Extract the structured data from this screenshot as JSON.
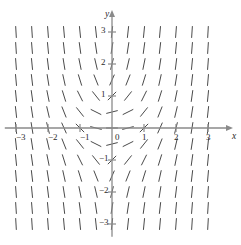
{
  "figure": {
    "type": "slope-field",
    "title": "",
    "background_color": "#ffffff",
    "width": 241,
    "height": 245
  },
  "axes": {
    "origin_px": {
      "x": 112,
      "y": 128
    },
    "unit_px": 32,
    "color": "#8a8a8a",
    "x_axis": {
      "name": "x",
      "name_px": {
        "x": 232,
        "y": 132
      },
      "range": [
        -3.35,
        3.35
      ],
      "arrow": "right",
      "tick_values": [
        -3,
        -2,
        -1,
        0,
        1,
        2,
        3
      ],
      "minor_tick_values": [
        -2.5,
        -1.5,
        -0.5,
        0.5,
        1.5,
        2.5
      ],
      "tick_labels": [
        "−3",
        "−2",
        "−1",
        "0",
        "1",
        "2",
        "3"
      ]
    },
    "y_axis": {
      "name": "y",
      "name_px": {
        "x": 105,
        "y": 10
      },
      "range": [
        -3.4,
        3.6
      ],
      "arrow": "up",
      "tick_values": [
        3,
        2,
        1,
        0,
        -1,
        -2,
        -3
      ],
      "minor_tick_values": [
        2.5,
        1.5,
        0.5,
        -0.5,
        -1.5,
        -2.5
      ],
      "tick_labels": [
        "3",
        "2",
        "1",
        "0",
        "−1",
        "−2",
        "−3"
      ]
    }
  },
  "chart_data": {
    "type": "scatter",
    "subtype": "slope-field",
    "title": "",
    "xlabel": "x",
    "ylabel": "y",
    "xlim": [
      -3.35,
      3.35
    ],
    "ylim": [
      -3.4,
      3.6
    ],
    "grid": false,
    "legend": null,
    "grid_spacing": 0.5,
    "grid_x_values": [
      -3,
      -2.5,
      -2,
      -1.5,
      -1,
      -0.5,
      0,
      0.5,
      1,
      1.5,
      2,
      2.5,
      3
    ],
    "grid_y_values": [
      3,
      2.5,
      2,
      1.5,
      1,
      0.5,
      0,
      -0.5,
      -1,
      -1.5,
      -2,
      -2.5,
      -3
    ],
    "segment_color": "#4a4a4a",
    "segment_length_px": 11,
    "slope_formula": "x*x + y*y"
  },
  "tick_labels": {
    "x": [
      {
        "text": "−3",
        "x": 16,
        "y": 133
      },
      {
        "text": "−2",
        "x": 48,
        "y": 133
      },
      {
        "text": "−1",
        "x": 80,
        "y": 133
      },
      {
        "text": "0",
        "x": 115,
        "y": 133
      },
      {
        "text": "1",
        "x": 142,
        "y": 133
      },
      {
        "text": "2",
        "x": 174,
        "y": 133
      },
      {
        "text": "3",
        "x": 206,
        "y": 133
      }
    ],
    "y": [
      {
        "text": "3",
        "x": 101,
        "y": 26
      },
      {
        "text": "2",
        "x": 101,
        "y": 58
      },
      {
        "text": "1",
        "x": 101,
        "y": 90
      },
      {
        "text": "−1",
        "x": 99,
        "y": 154
      },
      {
        "text": "−2",
        "x": 99,
        "y": 186
      },
      {
        "text": "−3",
        "x": 99,
        "y": 218
      }
    ]
  }
}
